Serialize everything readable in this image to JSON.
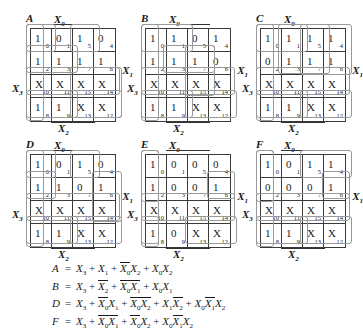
{
  "figure": {
    "top_partial_text": "",
    "axis_labels": {
      "top": "X0",
      "right": "X1",
      "bottom": "X2",
      "left": "X3"
    },
    "cell_order_indices": [
      [
        0,
        1,
        5,
        4
      ],
      [
        2,
        3,
        7,
        6
      ],
      [
        10,
        11,
        15,
        14
      ],
      [
        8,
        9,
        13,
        12
      ]
    ]
  },
  "kmaps": [
    {
      "name": "A",
      "rows": [
        [
          {
            "v": "1",
            "i": "0"
          },
          {
            "v": "0",
            "i": "1"
          },
          {
            "v": "1",
            "i": "5"
          },
          {
            "v": "0",
            "i": "4"
          }
        ],
        [
          {
            "v": "1",
            "i": "2"
          },
          {
            "v": "1",
            "i": "3"
          },
          {
            "v": "1",
            "i": "7"
          },
          {
            "v": "1",
            "i": "6"
          }
        ],
        [
          {
            "v": "X",
            "i": "10"
          },
          {
            "v": "X",
            "i": "11"
          },
          {
            "v": "X",
            "i": "15"
          },
          {
            "v": "X",
            "i": "14"
          }
        ],
        [
          {
            "v": "1",
            "i": "8"
          },
          {
            "v": "1",
            "i": "9"
          },
          {
            "v": "X",
            "i": "13"
          },
          {
            "v": "X",
            "i": "12"
          }
        ]
      ]
    },
    {
      "name": "B",
      "rows": [
        [
          {
            "v": "1",
            "i": "0"
          },
          {
            "v": "1",
            "i": "1"
          },
          {
            "v": "0",
            "i": "5"
          },
          {
            "v": "1",
            "i": "4"
          }
        ],
        [
          {
            "v": "1",
            "i": "2"
          },
          {
            "v": "1",
            "i": "3"
          },
          {
            "v": "1",
            "i": "7"
          },
          {
            "v": "0",
            "i": "6"
          }
        ],
        [
          {
            "v": "X",
            "i": "10"
          },
          {
            "v": "X",
            "i": "11"
          },
          {
            "v": "X",
            "i": "15"
          },
          {
            "v": "X",
            "i": "14"
          }
        ],
        [
          {
            "v": "1",
            "i": "8"
          },
          {
            "v": "1",
            "i": "9"
          },
          {
            "v": "X",
            "i": "13"
          },
          {
            "v": "X",
            "i": "12"
          }
        ]
      ]
    },
    {
      "name": "C",
      "rows": [
        [
          {
            "v": "1",
            "i": "0"
          },
          {
            "v": "1",
            "i": "1"
          },
          {
            "v": "1",
            "i": "5"
          },
          {
            "v": "1",
            "i": "4"
          }
        ],
        [
          {
            "v": "0",
            "i": "2"
          },
          {
            "v": "1",
            "i": "3"
          },
          {
            "v": "1",
            "i": "7"
          },
          {
            "v": "1",
            "i": "6"
          }
        ],
        [
          {
            "v": "X",
            "i": "10"
          },
          {
            "v": "X",
            "i": "11"
          },
          {
            "v": "X",
            "i": "15"
          },
          {
            "v": "X",
            "i": "14"
          }
        ],
        [
          {
            "v": "1",
            "i": "8"
          },
          {
            "v": "1",
            "i": "9"
          },
          {
            "v": "X",
            "i": "13"
          },
          {
            "v": "X",
            "i": "12"
          }
        ]
      ]
    },
    {
      "name": "D",
      "rows": [
        [
          {
            "v": "1",
            "i": "0"
          },
          {
            "v": "0",
            "i": "1"
          },
          {
            "v": "1",
            "i": "5"
          },
          {
            "v": "0",
            "i": "4"
          }
        ],
        [
          {
            "v": "1",
            "i": "2"
          },
          {
            "v": "1",
            "i": "3"
          },
          {
            "v": "0",
            "i": "7"
          },
          {
            "v": "1",
            "i": "6"
          }
        ],
        [
          {
            "v": "X",
            "i": "10"
          },
          {
            "v": "X",
            "i": "11"
          },
          {
            "v": "X",
            "i": "15"
          },
          {
            "v": "X",
            "i": "14"
          }
        ],
        [
          {
            "v": "1",
            "i": "8"
          },
          {
            "v": "1",
            "i": "9"
          },
          {
            "v": "X",
            "i": "13"
          },
          {
            "v": "X",
            "i": "12"
          }
        ]
      ]
    },
    {
      "name": "E",
      "rows": [
        [
          {
            "v": "1",
            "i": "0"
          },
          {
            "v": "0",
            "i": "1"
          },
          {
            "v": "0",
            "i": "5"
          },
          {
            "v": "0",
            "i": "4"
          }
        ],
        [
          {
            "v": "1",
            "i": "2"
          },
          {
            "v": "0",
            "i": "3"
          },
          {
            "v": "0",
            "i": "7"
          },
          {
            "v": "1",
            "i": "6"
          }
        ],
        [
          {
            "v": "X",
            "i": "10"
          },
          {
            "v": "X",
            "i": "11"
          },
          {
            "v": "X",
            "i": "15"
          },
          {
            "v": "X",
            "i": "14"
          }
        ],
        [
          {
            "v": "1",
            "i": "8"
          },
          {
            "v": "0",
            "i": "9"
          },
          {
            "v": "X",
            "i": "13"
          },
          {
            "v": "X",
            "i": "12"
          }
        ]
      ]
    },
    {
      "name": "F",
      "rows": [
        [
          {
            "v": "1",
            "i": "0"
          },
          {
            "v": "0",
            "i": "1"
          },
          {
            "v": "1",
            "i": "5"
          },
          {
            "v": "1",
            "i": "4"
          }
        ],
        [
          {
            "v": "0",
            "i": "2"
          },
          {
            "v": "0",
            "i": "3"
          },
          {
            "v": "0",
            "i": "7"
          },
          {
            "v": "1",
            "i": "6"
          }
        ],
        [
          {
            "v": "X",
            "i": "10"
          },
          {
            "v": "X",
            "i": "11"
          },
          {
            "v": "X",
            "i": "15"
          },
          {
            "v": "X",
            "i": "14"
          }
        ],
        [
          {
            "v": "1",
            "i": "8"
          },
          {
            "v": "1",
            "i": "9"
          },
          {
            "v": "X",
            "i": "13"
          },
          {
            "v": "X",
            "i": "12"
          }
        ]
      ]
    }
  ],
  "equations": [
    {
      "lhs": "A",
      "terms": [
        [
          {
            "t": "X",
            "s": "3",
            "b": false
          }
        ],
        [
          {
            "t": "X",
            "s": "1",
            "b": false
          }
        ],
        [
          {
            "t": "X",
            "s": "0",
            "b": true
          },
          {
            "t": "X",
            "s": "2",
            "b": false
          }
        ],
        [
          {
            "t": "X",
            "s": "0",
            "b": false
          },
          {
            "t": "X",
            "s": "2",
            "b": false
          }
        ]
      ]
    },
    {
      "lhs": "B",
      "terms": [
        [
          {
            "t": "X",
            "s": "3",
            "b": false
          }
        ],
        [
          {
            "t": "X",
            "s": "2",
            "b": true
          }
        ],
        [
          {
            "t": "X",
            "s": "0",
            "b": true
          },
          {
            "t": "X",
            "s": "1",
            "b": true
          }
        ],
        [
          {
            "t": "X",
            "s": "0",
            "b": false
          },
          {
            "t": "X",
            "s": "1",
            "b": false
          }
        ]
      ]
    },
    {
      "lhs": "D",
      "terms": [
        [
          {
            "t": "X",
            "s": "3",
            "b": false
          }
        ],
        [
          {
            "t": "X",
            "s": "0",
            "b": true
          },
          {
            "t": "X",
            "s": "1",
            "b": false
          }
        ],
        [
          {
            "t": "X",
            "s": "0",
            "b": true
          },
          {
            "t": "X",
            "s": "2",
            "b": true
          }
        ],
        [
          {
            "t": "X",
            "s": "1",
            "b": false
          },
          {
            "t": "X",
            "s": "2",
            "b": true
          }
        ],
        [
          {
            "t": "X",
            "s": "0",
            "b": false
          },
          {
            "t": "X",
            "s": "1",
            "b": true
          },
          {
            "t": "X",
            "s": "2",
            "b": false
          }
        ]
      ]
    },
    {
      "lhs": "F",
      "terms": [
        [
          {
            "t": "X",
            "s": "3",
            "b": false
          }
        ],
        [
          {
            "t": "X",
            "s": "0",
            "b": true
          },
          {
            "t": "X",
            "s": "1",
            "b": true
          }
        ],
        [
          {
            "t": "X",
            "s": "0",
            "b": true
          },
          {
            "t": "X",
            "s": "2",
            "b": false
          }
        ],
        [
          {
            "t": "X",
            "s": "0",
            "b": false
          },
          {
            "t": "X",
            "s": "1",
            "b": true
          },
          {
            "t": "X",
            "s": "2",
            "b": false
          }
        ]
      ]
    }
  ],
  "equals_sign": "=",
  "plus_sign": "+"
}
